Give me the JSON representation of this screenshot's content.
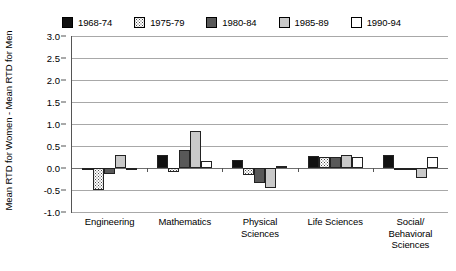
{
  "chart_data": {
    "type": "bar",
    "title": "",
    "xlabel": "",
    "ylabel": "Mean RTD for Women - Mean RTD for Men",
    "ylim": [
      -1.0,
      3.0
    ],
    "ytick_labels": [
      "3.0",
      "2.5",
      "2.0",
      "1.5",
      "1.0",
      "0.5",
      "0.0",
      "-0.5",
      "-1.0"
    ],
    "ytick_values": [
      3.0,
      2.5,
      2.0,
      1.5,
      1.0,
      0.5,
      0.0,
      -0.5,
      -1.0
    ],
    "grid": true,
    "legend_position": "top",
    "categories": [
      "Engineering",
      "Mathematics",
      "Physical Sciences",
      "Life Sciences",
      "Social/ Behavioral Sciences"
    ],
    "category_lines": [
      [
        "Engineering"
      ],
      [
        "Mathematics"
      ],
      [
        "Physical",
        "Sciences"
      ],
      [
        "Life Sciences"
      ],
      [
        "Social/",
        "Behavioral",
        "Sciences"
      ]
    ],
    "series": [
      {
        "name": "1968-74",
        "fill": "black",
        "values": [
          -0.03,
          0.3,
          0.18,
          0.28,
          0.3
        ]
      },
      {
        "name": "1975-79",
        "fill": "dotted",
        "values": [
          -0.5,
          -0.08,
          -0.15,
          0.25,
          0.0
        ]
      },
      {
        "name": "1980-84",
        "fill": "darkgray",
        "values": [
          -0.13,
          0.4,
          -0.35,
          0.25,
          -0.05
        ]
      },
      {
        "name": "1985-89",
        "fill": "lightgray",
        "values": [
          0.3,
          0.85,
          -0.45,
          0.3,
          -0.22
        ]
      },
      {
        "name": "1990-94",
        "fill": "white",
        "values": [
          0.0,
          0.15,
          0.05,
          0.25,
          0.25
        ]
      }
    ]
  },
  "legend": {
    "items": [
      {
        "label": "1968-74",
        "fill": "black"
      },
      {
        "label": "1975-79",
        "fill": "dotted"
      },
      {
        "label": "1980-84",
        "fill": "darkgray"
      },
      {
        "label": "1985-89",
        "fill": "lightgray"
      },
      {
        "label": "1990-94",
        "fill": "white"
      }
    ]
  }
}
